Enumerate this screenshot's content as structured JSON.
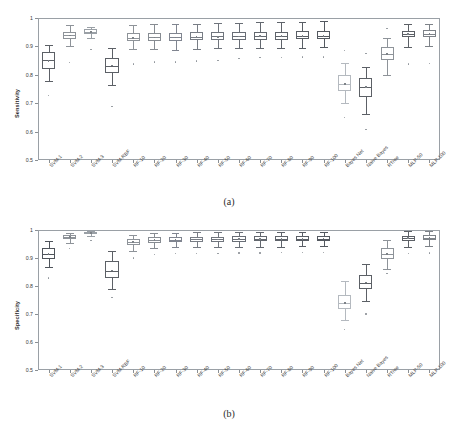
{
  "figure": {
    "caption_a": "(a)",
    "caption_b": "(b)"
  },
  "chart_data": [
    {
      "type": "box",
      "panel": "a",
      "title": "",
      "ylabel": "Sensitivity",
      "xlabel": "",
      "ylim": [
        0.5,
        1.0
      ],
      "yticks": [
        "0.5",
        "0.6",
        "0.7",
        "0.8",
        "0.9",
        "1"
      ],
      "ytick_values": [
        0.5,
        0.6,
        0.7,
        0.8,
        0.9,
        1.0
      ],
      "grid": false,
      "legend": "none",
      "categories": [
        "SVM-1",
        "SVM-2",
        "SVM-3",
        "SVM-RBF",
        "RF-10",
        "RF-20",
        "RF-30",
        "RF-40",
        "RF-50",
        "RF-60",
        "RF-70",
        "RF-80",
        "RF-90",
        "RF-100",
        "Bayes Net",
        "Naive Bayes",
        "RTree",
        "MLP-50",
        "MLP-100"
      ],
      "boxes": [
        {
          "label": "SVM-1",
          "whisker_low": 0.778,
          "q1": 0.822,
          "median": 0.853,
          "mean": 0.849,
          "q3": 0.88,
          "whisker_high": 0.905,
          "color": "#5c6066",
          "outliers": [
            0.727
          ]
        },
        {
          "label": "SVM-2",
          "whisker_low": 0.9,
          "q1": 0.925,
          "median": 0.94,
          "mean": 0.938,
          "q3": 0.952,
          "whisker_high": 0.975,
          "color": "#8e9399",
          "outliers": [
            0.843
          ]
        },
        {
          "label": "SVM-3",
          "whisker_low": 0.93,
          "q1": 0.943,
          "median": 0.952,
          "mean": 0.95,
          "q3": 0.96,
          "whisker_high": 0.968,
          "color": "#9aa0a6",
          "outliers": [
            0.888
          ]
        },
        {
          "label": "SVM-RBF",
          "whisker_low": 0.765,
          "q1": 0.805,
          "median": 0.83,
          "mean": 0.833,
          "q3": 0.858,
          "whisker_high": 0.893,
          "color": "#5c6066",
          "outliers": [
            0.688
          ]
        },
        {
          "label": "RF-10",
          "whisker_low": 0.89,
          "q1": 0.918,
          "median": 0.93,
          "mean": 0.929,
          "q3": 0.947,
          "whisker_high": 0.975,
          "color": "#8e9399",
          "outliers": [
            0.838
          ]
        },
        {
          "label": "RF-20",
          "whisker_low": 0.89,
          "q1": 0.92,
          "median": 0.932,
          "mean": 0.931,
          "q3": 0.947,
          "whisker_high": 0.978,
          "color": "#878c92",
          "outliers": [
            0.845
          ]
        },
        {
          "label": "RF-30",
          "whisker_low": 0.888,
          "q1": 0.92,
          "median": 0.932,
          "mean": 0.932,
          "q3": 0.948,
          "whisker_high": 0.978,
          "color": "#808590",
          "outliers": [
            0.845
          ]
        },
        {
          "label": "RF-40",
          "whisker_low": 0.89,
          "q1": 0.921,
          "median": 0.934,
          "mean": 0.933,
          "q3": 0.949,
          "whisker_high": 0.98,
          "color": "#787d85",
          "outliers": [
            0.848
          ]
        },
        {
          "label": "RF-50",
          "whisker_low": 0.893,
          "q1": 0.922,
          "median": 0.935,
          "mean": 0.934,
          "q3": 0.95,
          "whisker_high": 0.982,
          "color": "#70757d",
          "outliers": [
            0.85
          ]
        },
        {
          "label": "RF-60",
          "whisker_low": 0.893,
          "q1": 0.923,
          "median": 0.936,
          "mean": 0.935,
          "q3": 0.951,
          "whisker_high": 0.983,
          "color": "#696e76",
          "outliers": [
            0.857
          ]
        },
        {
          "label": "RF-70",
          "whisker_low": 0.895,
          "q1": 0.924,
          "median": 0.937,
          "mean": 0.936,
          "q3": 0.952,
          "whisker_high": 0.985,
          "color": "#63686f",
          "outliers": [
            0.86
          ]
        },
        {
          "label": "RF-80",
          "whisker_low": 0.895,
          "q1": 0.924,
          "median": 0.937,
          "mean": 0.936,
          "q3": 0.952,
          "whisker_high": 0.985,
          "color": "#5e636a",
          "outliers": [
            0.86
          ]
        },
        {
          "label": "RF-90",
          "whisker_low": 0.895,
          "q1": 0.925,
          "median": 0.938,
          "mean": 0.937,
          "q3": 0.953,
          "whisker_high": 0.987,
          "color": "#595e65",
          "outliers": [
            0.862
          ]
        },
        {
          "label": "RF-100",
          "whisker_low": 0.897,
          "q1": 0.925,
          "median": 0.938,
          "mean": 0.937,
          "q3": 0.953,
          "whisker_high": 0.988,
          "color": "#545960",
          "outliers": [
            0.862
          ]
        },
        {
          "label": "Bayes Net",
          "whisker_low": 0.7,
          "q1": 0.742,
          "median": 0.768,
          "mean": 0.767,
          "q3": 0.8,
          "whisker_high": 0.84,
          "color": "#b4b9bf",
          "outliers": [
            0.885,
            0.65
          ]
        },
        {
          "label": "Naive Bayes",
          "whisker_low": 0.663,
          "q1": 0.723,
          "median": 0.757,
          "mean": 0.757,
          "q3": 0.79,
          "whisker_high": 0.828,
          "color": "#5c6066",
          "outliers": [
            0.875,
            0.608
          ]
        },
        {
          "label": "RTree",
          "whisker_low": 0.8,
          "q1": 0.853,
          "median": 0.872,
          "mean": 0.873,
          "q3": 0.898,
          "whisker_high": 0.93,
          "color": "#8e9399",
          "outliers": [
            0.962
          ]
        },
        {
          "label": "MLP-50",
          "whisker_low": 0.898,
          "q1": 0.932,
          "median": 0.943,
          "mean": 0.943,
          "q3": 0.955,
          "whisker_high": 0.98,
          "color": "#5c6066",
          "outliers": [
            0.838
          ]
        },
        {
          "label": "MLP-100",
          "whisker_low": 0.9,
          "q1": 0.933,
          "median": 0.945,
          "mean": 0.944,
          "q3": 0.957,
          "whisker_high": 0.98,
          "color": "#7d8288",
          "outliers": [
            0.84
          ]
        }
      ]
    },
    {
      "type": "box",
      "panel": "b",
      "title": "",
      "ylabel": "Specificity",
      "xlabel": "",
      "ylim": [
        0.5,
        1.0
      ],
      "yticks": [
        "0.5",
        "0.6",
        "0.7",
        "0.8",
        "0.9",
        "1"
      ],
      "ytick_values": [
        0.5,
        0.6,
        0.7,
        0.8,
        0.9,
        1.0
      ],
      "grid": false,
      "legend": "none",
      "categories": [
        "SVM-1",
        "SVM-2",
        "SVM-3",
        "SVM-RBF",
        "RF-10",
        "RF-20",
        "RF-30",
        "RF-40",
        "RF-50",
        "RF-60",
        "RF-70",
        "RF-80",
        "RF-90",
        "RF-100",
        "Bayes Net",
        "Naive Bayes",
        "RTree",
        "MLP-50",
        "MLP-100"
      ],
      "boxes": [
        {
          "label": "SVM-1",
          "whisker_low": 0.868,
          "q1": 0.898,
          "median": 0.915,
          "mean": 0.914,
          "q3": 0.935,
          "whisker_high": 0.962,
          "color": "#4f545b",
          "outliers": [
            0.828
          ]
        },
        {
          "label": "SVM-2",
          "whisker_low": 0.955,
          "q1": 0.968,
          "median": 0.975,
          "mean": 0.974,
          "q3": 0.982,
          "whisker_high": 0.99,
          "color": "#8e9399",
          "outliers": [
            0.935
          ]
        },
        {
          "label": "SVM-3",
          "whisker_low": 0.98,
          "q1": 0.986,
          "median": 0.99,
          "mean": 0.989,
          "q3": 0.993,
          "whisker_high": 0.998,
          "color": "#9aa0a6",
          "outliers": [
            0.962
          ]
        },
        {
          "label": "SVM-RBF",
          "whisker_low": 0.79,
          "q1": 0.83,
          "median": 0.855,
          "mean": 0.856,
          "q3": 0.888,
          "whisker_high": 0.925,
          "color": "#5c6066",
          "outliers": [
            0.76
          ]
        },
        {
          "label": "RF-10",
          "whisker_low": 0.925,
          "q1": 0.948,
          "median": 0.958,
          "mean": 0.957,
          "q3": 0.968,
          "whisker_high": 0.983,
          "color": "#8e9399",
          "outliers": [
            0.9
          ]
        },
        {
          "label": "RF-20",
          "whisker_low": 0.935,
          "q1": 0.955,
          "median": 0.965,
          "mean": 0.964,
          "q3": 0.974,
          "whisker_high": 0.99,
          "color": "#878c92",
          "outliers": [
            0.912
          ]
        },
        {
          "label": "RF-30",
          "whisker_low": 0.938,
          "q1": 0.957,
          "median": 0.966,
          "mean": 0.965,
          "q3": 0.975,
          "whisker_high": 0.99,
          "color": "#808590",
          "outliers": [
            0.915
          ]
        },
        {
          "label": "RF-40",
          "whisker_low": 0.938,
          "q1": 0.957,
          "median": 0.967,
          "mean": 0.966,
          "q3": 0.976,
          "whisker_high": 0.992,
          "color": "#787d85",
          "outliers": [
            0.916
          ]
        },
        {
          "label": "RF-50",
          "whisker_low": 0.94,
          "q1": 0.958,
          "median": 0.967,
          "mean": 0.966,
          "q3": 0.976,
          "whisker_high": 0.992,
          "color": "#70757d",
          "outliers": [
            0.917
          ]
        },
        {
          "label": "RF-60",
          "whisker_low": 0.94,
          "q1": 0.958,
          "median": 0.968,
          "mean": 0.967,
          "q3": 0.977,
          "whisker_high": 0.992,
          "color": "#696e76",
          "outliers": [
            0.918
          ]
        },
        {
          "label": "RF-70",
          "whisker_low": 0.941,
          "q1": 0.959,
          "median": 0.968,
          "mean": 0.967,
          "q3": 0.977,
          "whisker_high": 0.993,
          "color": "#63686f",
          "outliers": [
            0.918
          ]
        },
        {
          "label": "RF-80",
          "whisker_low": 0.941,
          "q1": 0.959,
          "median": 0.968,
          "mean": 0.968,
          "q3": 0.977,
          "whisker_high": 0.993,
          "color": "#5e636a",
          "outliers": [
            0.919
          ]
        },
        {
          "label": "RF-90",
          "whisker_low": 0.942,
          "q1": 0.96,
          "median": 0.969,
          "mean": 0.968,
          "q3": 0.978,
          "whisker_high": 0.993,
          "color": "#595e65",
          "outliers": [
            0.92
          ]
        },
        {
          "label": "RF-100",
          "whisker_low": 0.942,
          "q1": 0.96,
          "median": 0.969,
          "mean": 0.969,
          "q3": 0.978,
          "whisker_high": 0.994,
          "color": "#545960",
          "outliers": [
            0.92
          ]
        },
        {
          "label": "Bayes Net",
          "whisker_low": 0.68,
          "q1": 0.718,
          "median": 0.74,
          "mean": 0.74,
          "q3": 0.768,
          "whisker_high": 0.818,
          "color": "#b4b9bf",
          "outliers": [
            0.645
          ]
        },
        {
          "label": "Naive Bayes",
          "whisker_low": 0.745,
          "q1": 0.79,
          "median": 0.812,
          "mean": 0.813,
          "q3": 0.84,
          "whisker_high": 0.88,
          "color": "#5c6066",
          "outliers": [
            0.7
          ]
        },
        {
          "label": "RTree",
          "whisker_low": 0.86,
          "q1": 0.898,
          "median": 0.915,
          "mean": 0.915,
          "q3": 0.935,
          "whisker_high": 0.963,
          "color": "#8e9399",
          "outliers": [
            0.845
          ]
        },
        {
          "label": "MLP-50",
          "whisker_low": 0.94,
          "q1": 0.962,
          "median": 0.972,
          "mean": 0.971,
          "q3": 0.98,
          "whisker_high": 0.995,
          "color": "#5c6066",
          "outliers": [
            0.915
          ]
        },
        {
          "label": "MLP-100",
          "whisker_low": 0.942,
          "q1": 0.963,
          "median": 0.973,
          "mean": 0.972,
          "q3": 0.981,
          "whisker_high": 0.995,
          "color": "#7d8288",
          "outliers": [
            0.918
          ]
        }
      ]
    }
  ]
}
